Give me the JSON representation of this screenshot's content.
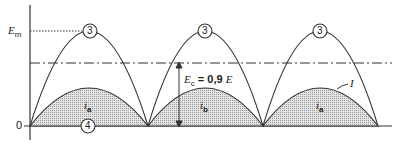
{
  "diagram": {
    "y_axis_labels": {
      "top": "E",
      "top_sub": "m",
      "bottom": "0"
    },
    "peak_markers": [
      "3",
      "3",
      "3"
    ],
    "baseline_marker": "4",
    "threshold_label": {
      "prefix": "E",
      "sub": "c",
      "text": " = 0,9 ",
      "suffix": "E"
    },
    "current_labels": [
      {
        "main": "i",
        "sub": "a"
      },
      {
        "main": "i",
        "sub": "b"
      },
      {
        "main": "i",
        "sub": "a"
      }
    ],
    "curve_label": "I",
    "colors": {
      "line": "#333333",
      "fill": "#d6d6d6"
    }
  }
}
